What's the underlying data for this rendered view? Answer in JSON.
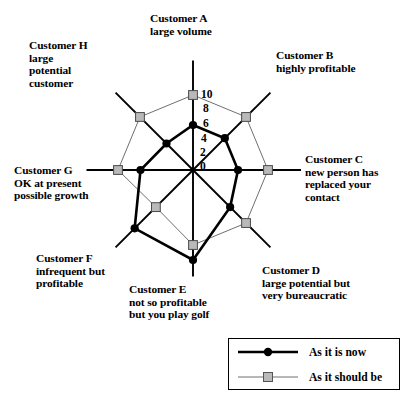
{
  "chart_data": {
    "type": "radar",
    "title": "",
    "categories": [
      "Customer A\nlarge volume",
      "Customer B\nhighly profitable",
      "Customer C\nnew person has\nreplaced your\ncontact",
      "Customer D\nlarge potential but\nvery bureaucratic",
      "Customer E\nnot so profitable\nbut you play golf",
      "Customer F\ninfrequent but\nprofitable",
      "Customer G\nOK at present\npossible growth",
      "Customer H\nlarge\npotential\ncustomer"
    ],
    "category_keys": [
      "A",
      "B",
      "C",
      "D",
      "E",
      "F",
      "G",
      "H"
    ],
    "series": [
      {
        "name": "As it is now",
        "values": [
          6,
          6,
          6,
          7,
          12,
          11,
          7,
          5
        ],
        "color": "#000000",
        "marker": "filled-circle",
        "line_width": 2.6
      },
      {
        "name": "As it should be",
        "values": [
          10,
          10,
          10,
          10,
          10,
          7,
          10,
          10
        ],
        "color": "#777777",
        "marker": "grey-square",
        "line_width": 1.0
      }
    ],
    "rticks": [
      10,
      8,
      6,
      4,
      2,
      0
    ],
    "rlim": [
      0,
      10
    ],
    "rlabel_axis": "Customer A",
    "grid": false,
    "legend_position": "bottom-right",
    "angles_deg": [
      90,
      45,
      0,
      -45,
      -90,
      -135,
      180,
      135
    ]
  },
  "labels": {
    "A": {
      "line1": "Customer A",
      "line2": "large volume"
    },
    "B": {
      "line1": "Customer B",
      "line2": "highly profitable"
    },
    "C": {
      "line1": "Customer C",
      "line2": "new person has",
      "line3": "replaced your",
      "line4": "contact"
    },
    "D": {
      "line1": "Customer D",
      "line2": "large potential but",
      "line3": "very bureaucratic"
    },
    "E": {
      "line1": "Customer E",
      "line2": "not so profitable",
      "line3": "but you play golf"
    },
    "F": {
      "line1": "Customer F",
      "line2": "infrequent but",
      "line3": "profitable"
    },
    "G": {
      "line1": "Customer G",
      "line2": "OK at present",
      "line3": "possible growth"
    },
    "H": {
      "line1": "Customer H",
      "line2": "large",
      "line3": "potential",
      "line4": "customer"
    }
  },
  "label_text": {
    "A": "Customer A\nlarge volume",
    "B": "Customer B\nhighly profitable",
    "C": "Customer C\nnew person has\nreplaced your\ncontact",
    "D": "Customer D\nlarge potential but\nvery bureaucratic",
    "E": "Customer E\nnot so profitable\nbut you play golf",
    "F": "Customer F\ninfrequent but\nprofitable",
    "G": "Customer G\nOK at present\npossible growth",
    "H": "Customer H\nlarge\npotential\ncustomer"
  },
  "ticks": {
    "t10": "10",
    "t8": "8",
    "t6": "6",
    "t4": "4",
    "t2": "2",
    "t0": "0"
  },
  "legend": {
    "items": [
      {
        "label": "As it is now",
        "style": "filled-circle-thick-black"
      },
      {
        "label": "As it should be",
        "style": "grey-square-thin-line"
      }
    ],
    "item1_label": "As it is now",
    "item2_label": "As it should be"
  },
  "colors": {
    "now_line": "#000000",
    "should_line": "#6f6f6f",
    "should_marker_fill": "#b9b9b9",
    "axis": "#000000",
    "background": "#ffffff"
  }
}
